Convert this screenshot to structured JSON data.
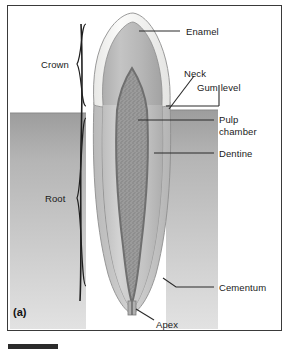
{
  "figure": {
    "panel_label": "(a)"
  },
  "labels": {
    "enamel": "Enamel",
    "crown": "Crown",
    "neck": "Neck",
    "gum_level": "Gum level",
    "pulp_line1": "Pulp",
    "pulp_line2": "chamber",
    "dentine": "Dentine",
    "root": "Root",
    "cementum": "Cementum",
    "apex": "Apex"
  },
  "colors": {
    "frame": "#3a3a3a",
    "background": "#ffffff",
    "enamel": "#f4f4f2",
    "enamel_outline": "#9a9a9a",
    "dentine": "#b4b4b4",
    "dentine_dark": "#a0a0a0",
    "pulp": "#8f8f8f",
    "pulp_outline": "#6f6f6f",
    "cementum": "#c9c9c9",
    "gum": "#b9b9b9",
    "gum_dark": "#9d9d9d",
    "leader": "#2b2b2b",
    "text": "#1a1a1a",
    "bottom_bar": "#2b2b2b"
  }
}
